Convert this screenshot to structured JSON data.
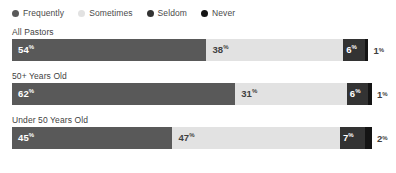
{
  "legend": {
    "position": "top-left",
    "items": [
      {
        "label": "Frequently",
        "color": "#595959",
        "icon": "legend-dot-icon"
      },
      {
        "label": "Sometimes",
        "color": "#e2e2e2",
        "icon": "legend-dot-icon"
      },
      {
        "label": "Seldom",
        "color": "#333333",
        "icon": "legend-dot-icon"
      },
      {
        "label": "Never",
        "color": "#141414",
        "icon": "legend-dot-icon"
      }
    ]
  },
  "rows": [
    {
      "label": "All Pastors",
      "segments": [
        {
          "series": "Frequently",
          "value": 54,
          "display": "54",
          "unit": "%",
          "color": "#595959",
          "text_color": "#ffffff",
          "inside": true
        },
        {
          "series": "Sometimes",
          "value": 38,
          "display": "38",
          "unit": "%",
          "color": "#e2e2e2",
          "text_color": "#3f3f3f",
          "inside": true
        },
        {
          "series": "Seldom",
          "value": 6,
          "display": "6",
          "unit": "%",
          "color": "#333333",
          "text_color": "#ffffff",
          "inside": true
        },
        {
          "series": "Never",
          "value": 1,
          "display": "1",
          "unit": "%",
          "color": "#141414",
          "text_color": "#3f3f3f",
          "inside": false
        }
      ]
    },
    {
      "label": "50+ Years Old",
      "segments": [
        {
          "series": "Frequently",
          "value": 62,
          "display": "62",
          "unit": "%",
          "color": "#595959",
          "text_color": "#ffffff",
          "inside": true
        },
        {
          "series": "Sometimes",
          "value": 31,
          "display": "31",
          "unit": "%",
          "color": "#e2e2e2",
          "text_color": "#3f3f3f",
          "inside": true
        },
        {
          "series": "Seldom",
          "value": 6,
          "display": "6",
          "unit": "%",
          "color": "#333333",
          "text_color": "#ffffff",
          "inside": true
        },
        {
          "series": "Never",
          "value": 1,
          "display": "1",
          "unit": "%",
          "color": "#141414",
          "text_color": "#3f3f3f",
          "inside": false
        }
      ]
    },
    {
      "label": "Under 50 Years Old",
      "segments": [
        {
          "series": "Frequently",
          "value": 45,
          "display": "45",
          "unit": "%",
          "color": "#595959",
          "text_color": "#ffffff",
          "inside": true
        },
        {
          "series": "Sometimes",
          "value": 47,
          "display": "47",
          "unit": "%",
          "color": "#e2e2e2",
          "text_color": "#3f3f3f",
          "inside": true
        },
        {
          "series": "Seldom",
          "value": 7,
          "display": "7",
          "unit": "%",
          "color": "#333333",
          "text_color": "#ffffff",
          "inside": true
        },
        {
          "series": "Never",
          "value": 2,
          "display": "2",
          "unit": "%",
          "color": "#141414",
          "text_color": "#3f3f3f",
          "inside": false
        }
      ]
    }
  ],
  "chart_data": {
    "type": "bar",
    "orientation": "horizontal",
    "stacked": true,
    "normalized": true,
    "title": "",
    "subtitle": "",
    "xlabel": "",
    "ylabel": "",
    "xlim": [
      0,
      100
    ],
    "grid": false,
    "legend_position": "top-left",
    "categories": [
      "All Pastors",
      "50+ Years Old",
      "Under 50 Years Old"
    ],
    "series": [
      {
        "name": "Frequently",
        "color": "#595959",
        "values": [
          54,
          62,
          45
        ]
      },
      {
        "name": "Sometimes",
        "color": "#e2e2e2",
        "values": [
          38,
          31,
          47
        ]
      },
      {
        "name": "Seldom",
        "color": "#333333",
        "values": [
          6,
          6,
          7
        ]
      },
      {
        "name": "Never",
        "color": "#141414",
        "values": [
          1,
          1,
          2
        ]
      }
    ],
    "data_labels": [
      [
        "54%",
        "38%",
        "6%",
        "1%"
      ],
      [
        "62%",
        "31%",
        "6%",
        "1%"
      ],
      [
        "45%",
        "47%",
        "7%",
        "2%"
      ]
    ],
    "value_unit": "%"
  }
}
